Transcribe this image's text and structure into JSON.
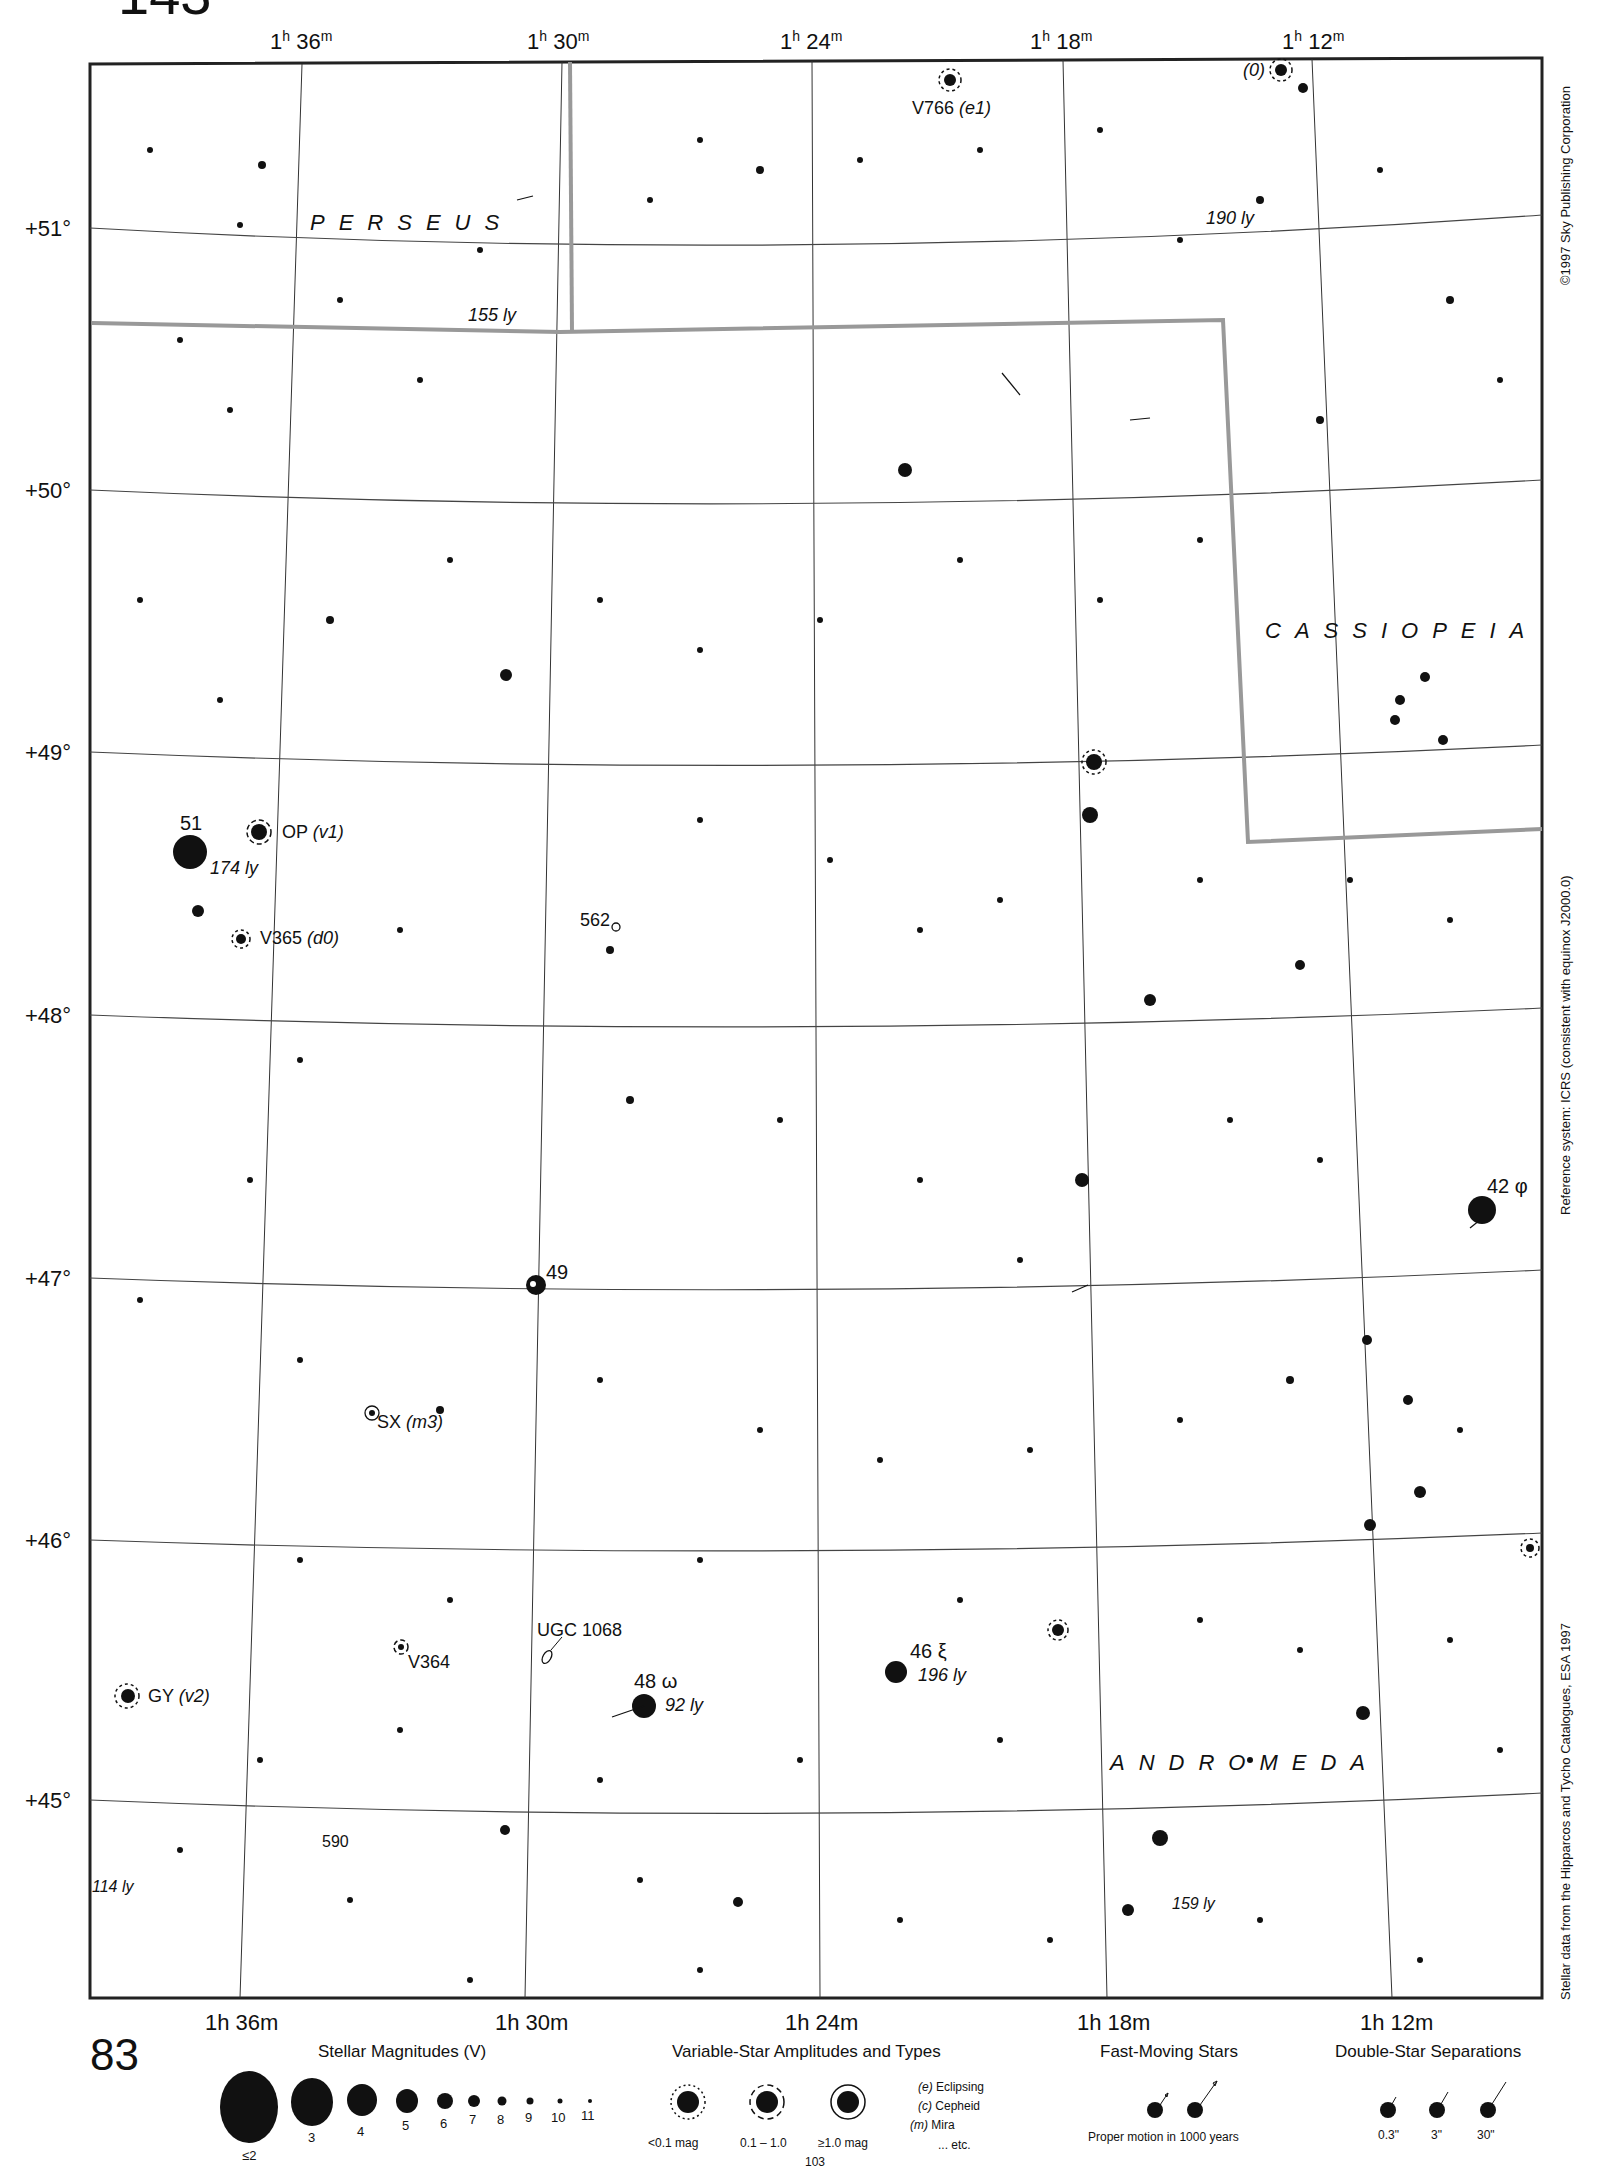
{
  "page": {
    "top_number": "143",
    "bottom_number": "83",
    "next_page": "103"
  },
  "ra_labels_top": [
    {
      "h": "1",
      "hsup": "h",
      "m": "36",
      "msup": "m",
      "x": 270
    },
    {
      "h": "1",
      "hsup": "h",
      "m": "30",
      "msup": "m",
      "x": 527
    },
    {
      "h": "1",
      "hsup": "h",
      "m": "24",
      "msup": "m",
      "x": 780
    },
    {
      "h": "1",
      "hsup": "h",
      "m": "18",
      "msup": "m",
      "x": 1030
    },
    {
      "h": "1",
      "hsup": "h",
      "m": "12",
      "msup": "m",
      "x": 1282
    }
  ],
  "ra_labels_bottom": [
    {
      "text": "1h 36m"
    },
    {
      "text": "1h 30m"
    },
    {
      "text": "1h 24m"
    },
    {
      "text": "1h 18m"
    },
    {
      "text": "1h 12m"
    }
  ],
  "dec_labels": [
    "+51°",
    "+50°",
    "+49°",
    "+48°",
    "+47°",
    "+46°",
    "+45°"
  ],
  "constellations": {
    "perseus": "PERSEUS",
    "cassiopeia": "CASSIOPEIA",
    "andromeda": "ANDROMEDA"
  },
  "labels": {
    "v766": "V766",
    "v766_type": "(e1)",
    "zero": "(0)",
    "ly190": "190 ly",
    "ly155": "155 ly",
    "star51": "51",
    "ly174": "174 ly",
    "op": "OP",
    "op_type": "(v1)",
    "v365": "V365",
    "v365_type": "(d0)",
    "n562": "562",
    "star49": "49",
    "star42": "42 φ",
    "sx": "SX",
    "sx_type": "(m3)",
    "v364": "V364",
    "ugc": "UGC 1068",
    "gy": "GY",
    "gy_type": "(v2)",
    "star48": "48 ω",
    "ly92": "92 ly",
    "star46": "46 ξ",
    "ly196": "196 ly",
    "n590": "590",
    "ly114": "114 ly",
    "ly159": "159 ly"
  },
  "side_text": {
    "copyright": "©1997 Sky Publishing Corporation",
    "reference": "Reference system: ICRS (consistent with equinox J2000.0)",
    "source": "Stellar data from the Hipparcos and Tycho Catalogues, ESA 1997"
  },
  "legend": {
    "magnitudes": {
      "title": "Stellar Magnitudes (V)",
      "items": [
        "≤2",
        "3",
        "4",
        "5",
        "6",
        "7",
        "8",
        "9",
        "10",
        "11"
      ]
    },
    "variables": {
      "title": "Variable-Star Amplitudes and Types",
      "amplitudes": [
        "<0.1 mag",
        "0.1 – 1.0",
        "≥1.0 mag"
      ],
      "types": [
        {
          "code": "(e)",
          "name": "Eclipsing"
        },
        {
          "code": "(c)",
          "name": "Cepheid"
        },
        {
          "code": "(m)",
          "name": "Mira"
        },
        {
          "code": "",
          "name": "... etc."
        }
      ]
    },
    "fast": {
      "title": "Fast-Moving Stars",
      "caption": "Proper motion in 1000 years"
    },
    "doubles": {
      "title": "Double-Star Separations",
      "items": [
        "0.3\"",
        "3\"",
        "30\""
      ]
    }
  }
}
